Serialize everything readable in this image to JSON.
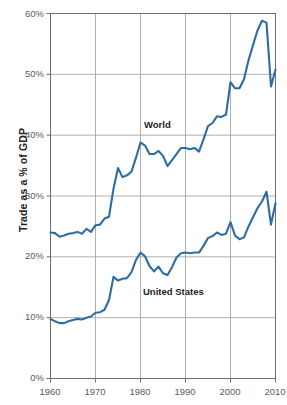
{
  "chart_data": {
    "type": "line",
    "title": "",
    "subtitle": "",
    "xlabel": "",
    "ylabel": "Trade as a % of GDP",
    "xlim": [
      1960,
      2010
    ],
    "ylim": [
      0,
      60
    ],
    "grid": true,
    "legend_position": "inline-annotation",
    "y_tick_labels": [
      "0%",
      "10%",
      "20%",
      "30%",
      "40%",
      "50%",
      "60%"
    ],
    "y_tick_values": [
      0,
      10,
      20,
      30,
      40,
      50,
      60
    ],
    "x_tick_labels": [
      "1960",
      "1970",
      "1980",
      "1990",
      "2000",
      "2010"
    ],
    "x_tick_values": [
      1960,
      1970,
      1980,
      1990,
      2000,
      2010
    ],
    "series_color": "#2e6da4",
    "x": [
      1960,
      1961,
      1962,
      1963,
      1964,
      1965,
      1966,
      1967,
      1968,
      1969,
      1970,
      1971,
      1972,
      1973,
      1974,
      1975,
      1976,
      1977,
      1978,
      1979,
      1980,
      1981,
      1982,
      1983,
      1984,
      1985,
      1986,
      1987,
      1988,
      1989,
      1990,
      1991,
      1992,
      1993,
      1994,
      1995,
      1996,
      1997,
      1998,
      1999,
      2000,
      2001,
      2002,
      2003,
      2004,
      2005,
      2006,
      2007,
      2008,
      2009,
      2010
    ],
    "series": [
      {
        "name": "World",
        "color": "#2e6da4",
        "values": [
          24.0,
          23.9,
          23.3,
          23.5,
          23.8,
          23.9,
          24.1,
          23.8,
          24.6,
          24.1,
          25.2,
          25.3,
          26.3,
          26.6,
          31.2,
          34.6,
          33.1,
          33.4,
          34.0,
          36.3,
          38.8,
          38.3,
          36.9,
          36.9,
          37.4,
          36.6,
          34.9,
          35.9,
          36.9,
          37.9,
          37.9,
          37.7,
          37.9,
          37.3,
          39.3,
          41.5,
          42.0,
          43.1,
          43.0,
          43.4,
          48.7,
          47.7,
          47.7,
          49.2,
          52.3,
          54.8,
          57.2,
          58.8,
          58.5,
          48.0,
          50.8
        ]
      },
      {
        "name": "United States",
        "color": "#2e6da4",
        "values": [
          9.8,
          9.4,
          9.1,
          9.1,
          9.4,
          9.6,
          9.8,
          9.7,
          10.0,
          10.2,
          10.8,
          10.9,
          11.3,
          12.9,
          16.7,
          16.1,
          16.4,
          16.5,
          17.5,
          19.5,
          20.7,
          20.1,
          18.5,
          17.6,
          18.4,
          17.3,
          17.0,
          18.3,
          19.9,
          20.6,
          20.7,
          20.6,
          20.7,
          20.7,
          21.8,
          23.1,
          23.4,
          24.0,
          23.6,
          23.8,
          25.7,
          23.5,
          22.9,
          23.2,
          25.0,
          26.5,
          28.0,
          29.1,
          30.7,
          25.3,
          28.8
        ]
      }
    ],
    "annotations": [
      {
        "text": "World",
        "x": 1981,
        "y": 41.5
      },
      {
        "text": "United States",
        "x": 1984,
        "y": 14.2
      }
    ]
  },
  "axis": {
    "y_title": "Trade as a % of GDP",
    "y_ticks": [
      "60%",
      "50%",
      "40%",
      "30%",
      "20%",
      "10%",
      "0%"
    ],
    "x_ticks": [
      "1960",
      "1970",
      "1980",
      "1990",
      "2000",
      "2010"
    ]
  },
  "labels": {
    "world": "World",
    "united_states": "United States"
  },
  "colors": {
    "line": "#2e6da4",
    "grid": "#9a9a9a",
    "frame": "#6e6e6e",
    "tick_text": "#5c5c5c",
    "title_text": "#242424",
    "background": "#ffffff"
  }
}
